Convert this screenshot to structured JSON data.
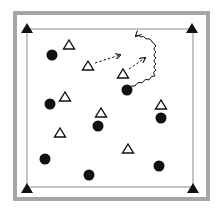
{
  "diagram": {
    "colors": {
      "background": "#ffffff",
      "outer_border": "#a6a6a6",
      "inner_line": "#8c8c8c",
      "marker": "#111111"
    },
    "outer_border": {
      "x": 15,
      "y": 13,
      "w": 193,
      "h": 186,
      "stroke": 4
    },
    "inner_field": {
      "x1": 27,
      "y1": 29,
      "x2": 193,
      "y2": 187
    },
    "corner_cones": [
      {
        "id": "top-left",
        "x": 27,
        "y": 29
      },
      {
        "id": "top-right",
        "x": 192,
        "y": 29
      },
      {
        "id": "bottom-left",
        "x": 27,
        "y": 189
      },
      {
        "id": "bottom-right",
        "x": 193,
        "y": 189
      }
    ],
    "players_dots": [
      {
        "x": 52,
        "y": 55
      },
      {
        "x": 127,
        "y": 90
      },
      {
        "x": 50,
        "y": 104
      },
      {
        "x": 98,
        "y": 126
      },
      {
        "x": 161,
        "y": 118
      },
      {
        "x": 45,
        "y": 159
      },
      {
        "x": 89,
        "y": 175
      },
      {
        "x": 159,
        "y": 166
      }
    ],
    "players_triangles": [
      {
        "x": 69,
        "y": 45
      },
      {
        "x": 88,
        "y": 66
      },
      {
        "x": 123,
        "y": 74
      },
      {
        "x": 65,
        "y": 97
      },
      {
        "x": 101,
        "y": 113
      },
      {
        "x": 161,
        "y": 105
      },
      {
        "x": 60,
        "y": 133
      },
      {
        "x": 128,
        "y": 149
      }
    ],
    "dashed_arrows": [
      {
        "from": [
          95,
          63
        ],
        "to": [
          120,
          55
        ]
      },
      {
        "from": [
          129,
          69
        ],
        "to": [
          145,
          58
        ]
      }
    ],
    "wavy_arrow": {
      "path": "M128,88 q4,-3 7,-2 q3,-5 7,-3 q3,-5 7,-3 q2,-5 6,-4 q-3,-4 1,-6 q-4,-3 0,-6 q-4,-3 0,-6 q-4,-3 0,-6 q-4,-3 0,-6 q-3,-4 -4,-4 q-1,-4 -6,-3 q-2,-4 -5,-2 q-3,-3 -5,-1",
      "head": [
        131,
        21
      ]
    }
  }
}
